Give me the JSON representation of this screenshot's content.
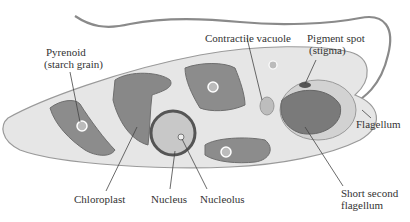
{
  "diagram": {
    "colors": {
      "background": "#ffffff",
      "cytoplasm": "#e6e6e6",
      "cell_outline": "#9a9a9a",
      "chloroplast": "#8c8c8c",
      "chloroplast_dark": "#6e6e6e",
      "nucleus": "#c8c8c8",
      "nucleus_rim": "#555555",
      "leader_line": "#444444",
      "label_text": "#333333"
    },
    "labels": {
      "pyrenoid_line1": "Pyrenoid",
      "pyrenoid_line2": "(starch grain)",
      "contractile_vacuole": "Contractile vacuole",
      "pigment_spot_line1": "Pigment spot",
      "pigment_spot_line2": "(stigma)",
      "flagellum": "Flagellum",
      "chloroplast": "Chloroplast",
      "nucleus": "Nucleus",
      "nucleolus": "Nucleolus",
      "short_second_flagellum_line1": "Short second",
      "short_second_flagellum_line2": "flagellum"
    }
  }
}
